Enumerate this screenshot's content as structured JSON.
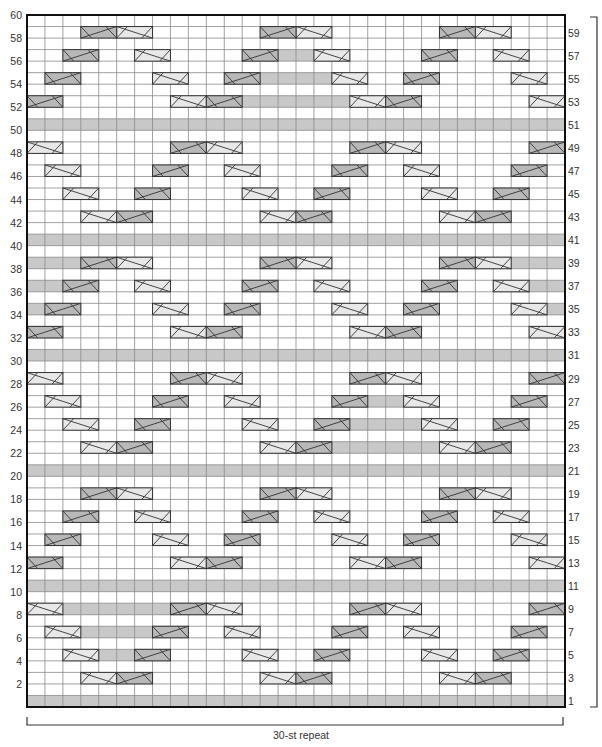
{
  "chart": {
    "columns": 30,
    "rows": 60,
    "repeat_label": "30-st repeat",
    "left_labels": [
      "2",
      "4",
      "6",
      "8",
      "10",
      "12",
      "14",
      "16",
      "18",
      "20",
      "22",
      "24",
      "26",
      "28",
      "30",
      "32",
      "34",
      "36",
      "38",
      "40",
      "42",
      "44",
      "46",
      "48",
      "50",
      "52",
      "54",
      "56",
      "58",
      "60"
    ],
    "right_labels": [
      "1",
      "3",
      "5",
      "7",
      "9",
      "11",
      "13",
      "15",
      "17",
      "19",
      "21",
      "23",
      "25",
      "27",
      "29",
      "31",
      "33",
      "35",
      "37",
      "39",
      "41",
      "43",
      "45",
      "47",
      "49",
      "51",
      "53",
      "55",
      "57",
      "59"
    ],
    "colors": {
      "grid_line": "#8a8a8a",
      "border": "#111111",
      "gray_fill": "#c8c8c8",
      "light_cable": "#e8e8e8",
      "dark_cable": "#b8b8b8",
      "cable_line": "#333333"
    },
    "legend_note": "L = light cable (2 sts), D = dark cable (2 sts); gray = shaded stitches",
    "row_data": {
      "1": {
        "gray": "all"
      },
      "3": {
        "L": [
          4,
          14,
          24
        ],
        "D": [
          6,
          16,
          26
        ],
        "gray": []
      },
      "5": {
        "L": [
          3,
          13,
          23
        ],
        "D": [
          7,
          17,
          27
        ],
        "gray": [
          5,
          6
        ]
      },
      "7": {
        "L": [
          2,
          12,
          22
        ],
        "D": [
          8,
          18,
          28
        ],
        "gray": [
          4,
          5,
          6,
          7
        ]
      },
      "9": {
        "L": [
          1,
          11,
          21
        ],
        "D": [
          9,
          19,
          29
        ],
        "gray": [
          3,
          4,
          5,
          6,
          7,
          8
        ]
      },
      "11": {
        "gray": "all"
      },
      "13": {
        "D": [
          1,
          11,
          21
        ],
        "L": [
          9,
          19,
          29
        ],
        "gray": []
      },
      "15": {
        "D": [
          2,
          12,
          22
        ],
        "L": [
          8,
          18,
          28
        ],
        "gray": []
      },
      "17": {
        "D": [
          3,
          13,
          23
        ],
        "L": [
          7,
          17,
          27
        ],
        "gray": []
      },
      "19": {
        "D": [
          4,
          14,
          24
        ],
        "L": [
          6,
          16,
          26
        ],
        "gray": []
      },
      "21": {
        "gray": "all"
      },
      "23": {
        "L": [
          4,
          14,
          24
        ],
        "D": [
          6,
          16,
          26
        ],
        "gray": [
          18,
          19,
          20,
          21,
          22,
          23
        ]
      },
      "25": {
        "L": [
          3,
          13,
          23
        ],
        "D": [
          7,
          17,
          27
        ],
        "gray": [
          19,
          20,
          21,
          22
        ]
      },
      "27": {
        "L": [
          2,
          12,
          22
        ],
        "D": [
          8,
          18,
          28
        ],
        "gray": [
          20,
          21
        ]
      },
      "29": {
        "L": [
          1,
          11,
          21
        ],
        "D": [
          9,
          19,
          29
        ],
        "gray": []
      },
      "31": {
        "gray": "all"
      },
      "33": {
        "D": [
          1,
          11,
          21
        ],
        "L": [
          9,
          19,
          29
        ],
        "gray": []
      },
      "35": {
        "D": [
          2,
          12,
          22
        ],
        "L": [
          8,
          18,
          28
        ],
        "gray": [
          1,
          30
        ]
      },
      "37": {
        "D": [
          3,
          13,
          23
        ],
        "L": [
          7,
          17,
          27
        ],
        "gray": [
          1,
          2,
          29,
          30
        ]
      },
      "39": {
        "D": [
          4,
          14,
          24
        ],
        "L": [
          6,
          16,
          26
        ],
        "gray": [
          1,
          2,
          3,
          28,
          29,
          30
        ]
      },
      "41": {
        "gray": "all"
      },
      "43": {
        "L": [
          4,
          14,
          24
        ],
        "D": [
          6,
          16,
          26
        ],
        "gray": []
      },
      "45": {
        "L": [
          3,
          13,
          23
        ],
        "D": [
          7,
          17,
          27
        ],
        "gray": []
      },
      "47": {
        "L": [
          2,
          12,
          22
        ],
        "D": [
          8,
          18,
          28
        ],
        "gray": []
      },
      "49": {
        "L": [
          1,
          11,
          21
        ],
        "D": [
          9,
          19,
          29
        ],
        "gray": []
      },
      "51": {
        "gray": "all"
      },
      "53": {
        "D": [
          1,
          11,
          21
        ],
        "L": [
          9,
          19,
          29
        ],
        "gray": [
          13,
          14,
          15,
          16,
          17,
          18
        ]
      },
      "55": {
        "D": [
          2,
          12,
          22
        ],
        "L": [
          8,
          18,
          28
        ],
        "gray": [
          14,
          15,
          16,
          17
        ]
      },
      "57": {
        "D": [
          3,
          13,
          23
        ],
        "L": [
          7,
          17,
          27
        ],
        "gray": [
          15,
          16
        ]
      },
      "59": {
        "D": [
          4,
          14,
          24
        ],
        "L": [
          6,
          16,
          26
        ],
        "gray": []
      }
    }
  }
}
